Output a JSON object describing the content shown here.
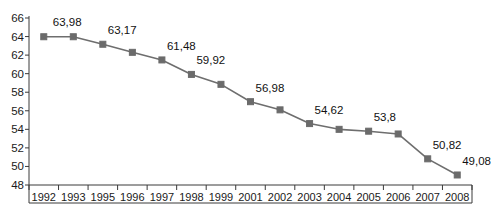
{
  "chart_data": {
    "type": "line",
    "title": "",
    "subtitle": "",
    "xlabel": "",
    "ylabel": "",
    "categories": [
      "1992",
      "1993",
      "1995",
      "1996",
      "1997",
      "1998",
      "1999",
      "2001",
      "2002",
      "2003",
      "2004",
      "2005",
      "2006",
      "2007",
      "2008"
    ],
    "values": [
      63.98,
      63.98,
      63.17,
      62.3,
      61.48,
      59.92,
      58.85,
      56.98,
      56.1,
      54.62,
      54.0,
      53.8,
      53.5,
      50.82,
      49.08
    ],
    "point_labels": [
      "63,98",
      "",
      "63,17",
      "",
      "61,48",
      "59,92",
      "",
      "56,98",
      "",
      "54,62",
      "",
      "53,8",
      "",
      "50,82",
      "49,08"
    ],
    "series": [
      {
        "name": "series-1",
        "values": [
          63.98,
          63.98,
          63.17,
          62.3,
          61.48,
          59.92,
          58.85,
          56.98,
          56.1,
          54.62,
          54.0,
          53.8,
          53.5,
          50.82,
          49.08
        ]
      }
    ],
    "ylim": [
      48,
      66
    ],
    "ytick_values": [
      66,
      64,
      62,
      60,
      58,
      56,
      54,
      52,
      50,
      48
    ],
    "ytick_labels": [
      "66",
      "64",
      "62",
      "60",
      "58",
      "56",
      "54",
      "52",
      "50",
      "48"
    ],
    "grid": false,
    "legend": false,
    "legend_position": "none",
    "marker": "square",
    "colors": {
      "line": "#6e6e6e",
      "marker": "#6b6b6b",
      "axis": "#3a3a3a",
      "text": "#1a1a1a",
      "background": "#ffffff"
    }
  }
}
